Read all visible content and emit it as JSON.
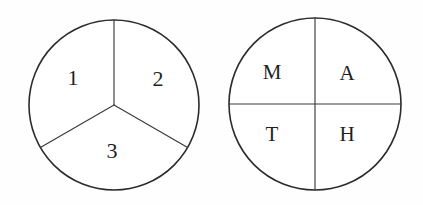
{
  "figure": {
    "background_color": "#fefefe",
    "stroke_color": "#2b2b2b",
    "divider_color": "#3a3a3a",
    "text_color": "#1f1f1f",
    "width": 423,
    "height": 205
  },
  "circles": [
    {
      "id": "left-circle",
      "name": "numbered-thirds-circle",
      "center_x": 114,
      "center_y": 105,
      "radius": 85,
      "division": "three-equal-sectors",
      "divider_angles_deg": [
        90,
        210,
        330
      ],
      "labels": [
        {
          "text": "1",
          "x": 73,
          "y": 80
        },
        {
          "text": "2",
          "x": 158,
          "y": 81
        },
        {
          "text": "3",
          "x": 112,
          "y": 153
        }
      ]
    },
    {
      "id": "right-circle",
      "name": "lettered-quadrants-circle",
      "center_x": 315,
      "center_y": 104,
      "radius": 86,
      "division": "four-quadrants",
      "labels": [
        {
          "text": "M",
          "x": 272,
          "y": 74
        },
        {
          "text": "A",
          "x": 347,
          "y": 75
        },
        {
          "text": "T",
          "x": 272,
          "y": 136
        },
        {
          "text": "H",
          "x": 347,
          "y": 136
        }
      ]
    }
  ]
}
